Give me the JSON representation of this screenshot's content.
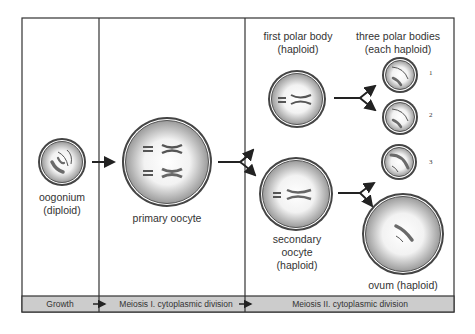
{
  "diagram": {
    "colors": {
      "border": "#222222",
      "bar_fill": "#cccccc",
      "cell_outer": "#7a7a7a",
      "cell_inner_light": "#ffffff",
      "chromosome_dark": "#6a6a6a"
    },
    "cells": {
      "oogonium": {
        "label_line1": "oogonium",
        "label_line2": "(diploid)"
      },
      "primary_oocyte": {
        "label": "primary oocyte"
      },
      "first_polar_body": {
        "label_line1": "first polar body",
        "label_line2": "(haploid)"
      },
      "three_polar_bodies": {
        "label_line1": "three polar bodies",
        "label_line2": "(each haploid)",
        "numbers": [
          "1",
          "2",
          "3"
        ]
      },
      "secondary_oocyte": {
        "label_line1": "secondary",
        "label_line2": "oocyte",
        "label_line3": "(haploid)"
      },
      "ovum": {
        "label": "ovum (haploid)"
      }
    },
    "stages": [
      {
        "label": "Growth"
      },
      {
        "label": "Meiosis I. cytoplasmic division"
      },
      {
        "label": "Meiosis II. cytoplasmic division"
      }
    ]
  }
}
